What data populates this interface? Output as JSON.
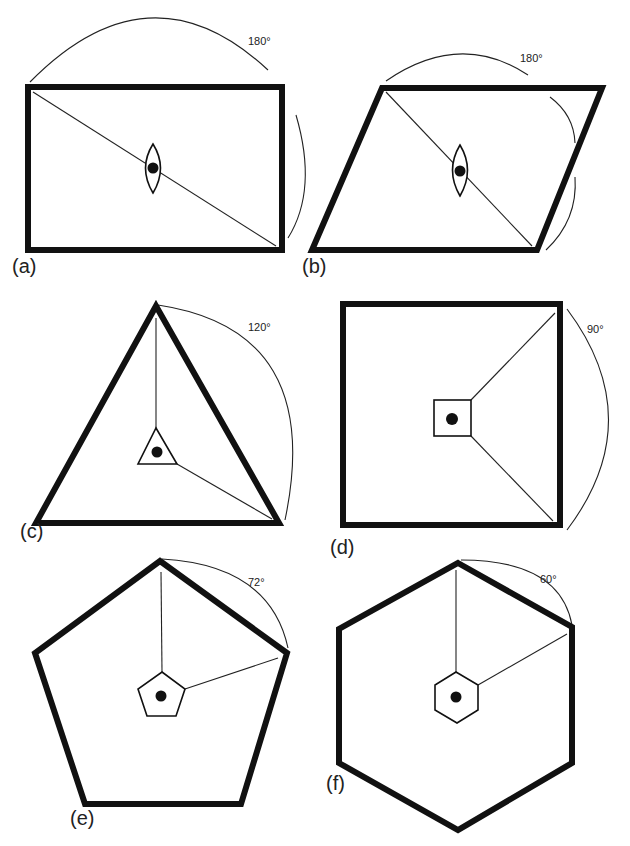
{
  "figure": {
    "panels": [
      {
        "id": "a",
        "label": "(a)",
        "shape": "rectangle",
        "angle": "180°",
        "cell_shape": "lens"
      },
      {
        "id": "b",
        "label": "(b)",
        "shape": "parallelogram",
        "angle": "180°",
        "cell_shape": "lens"
      },
      {
        "id": "c",
        "label": "(c)",
        "shape": "triangle",
        "angle": "120°",
        "cell_shape": "triangle"
      },
      {
        "id": "d",
        "label": "(d)",
        "shape": "square",
        "angle": "90°",
        "cell_shape": "square"
      },
      {
        "id": "e",
        "label": "(e)",
        "shape": "pentagon",
        "angle": "72°",
        "cell_shape": "pentagon"
      },
      {
        "id": "f",
        "label": "(f)",
        "shape": "hexagon",
        "angle": "60°",
        "cell_shape": "hexagon"
      }
    ],
    "colors": {
      "stroke": "#111111",
      "background": "#ffffff"
    }
  }
}
